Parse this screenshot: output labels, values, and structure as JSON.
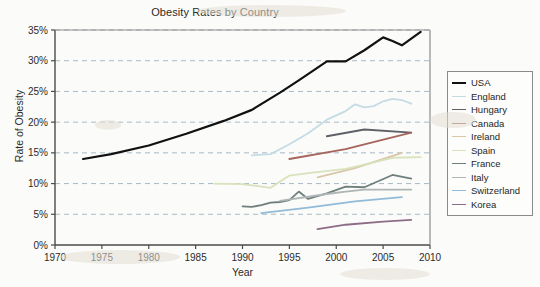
{
  "chart_data": {
    "type": "line",
    "title": "Obesity Rates by Country",
    "xlabel": "Year",
    "ylabel": "Rate of Obesity",
    "xlim": [
      1970,
      2010
    ],
    "ylim": [
      0,
      35
    ],
    "xticks": [
      "1970",
      "1975",
      "1980",
      "1985",
      "1990",
      "1995",
      "2000",
      "2005",
      "2010"
    ],
    "yticks": [
      "0%",
      "5%",
      "10%",
      "15%",
      "20%",
      "25%",
      "30%",
      "35%"
    ],
    "grid": "horizontal-dashed",
    "legend_position": "right-outside",
    "series": [
      {
        "name": "USA",
        "color": "#111111",
        "width": 2.2,
        "x": [
          1973,
          1976,
          1980,
          1984,
          1988,
          1991,
          1994,
          1996,
          1999,
          2001,
          2003,
          2005,
          2006,
          2007,
          2009
        ],
        "values": [
          14.0,
          14.8,
          16.2,
          18.1,
          20.2,
          22.0,
          24.8,
          26.8,
          29.9,
          29.9,
          31.7,
          33.8,
          33.2,
          32.5,
          34.7
        ]
      },
      {
        "name": "England",
        "color": "#c5dbe5",
        "width": 1.8,
        "x": [
          1991,
          1993,
          1995,
          1997,
          1999,
          2001,
          2002,
          2003,
          2004,
          2005,
          2006,
          2007,
          2008
        ],
        "values": [
          14.6,
          14.8,
          16.4,
          18.2,
          20.4,
          21.8,
          22.9,
          22.4,
          22.6,
          23.4,
          23.8,
          23.6,
          23.0
        ]
      },
      {
        "name": "Hungary",
        "color": "#5f6168",
        "width": 1.9,
        "x": [
          1999,
          2003,
          2008
        ],
        "values": [
          17.7,
          18.8,
          18.3
        ]
      },
      {
        "name": "Canada",
        "color": "#a5655c",
        "width": 1.8,
        "x": [
          1995,
          2001,
          2003,
          2008
        ],
        "values": [
          14.0,
          15.6,
          16.4,
          18.3
        ]
      },
      {
        "name": "Ireland",
        "color": "#d8c7a8",
        "width": 1.8,
        "x": [
          1998,
          2002,
          2007
        ],
        "values": [
          11.0,
          12.5,
          15.0
        ]
      },
      {
        "name": "Spain",
        "color": "#d8e2bc",
        "width": 1.8,
        "x": [
          1987,
          1990,
          1993,
          1995,
          1997,
          2001,
          2003,
          2006,
          2009
        ],
        "values": [
          10.0,
          9.9,
          9.3,
          11.3,
          11.7,
          12.4,
          13.1,
          14.2,
          14.3
        ]
      },
      {
        "name": "France",
        "color": "#6f7f7d",
        "width": 1.8,
        "x": [
          1990,
          1991,
          1992,
          1993,
          1994,
          1995,
          1996,
          1997,
          1999,
          2001,
          2003,
          2006,
          2008
        ],
        "values": [
          6.3,
          6.2,
          6.5,
          6.9,
          7.0,
          7.3,
          8.7,
          7.5,
          8.4,
          9.5,
          9.4,
          11.4,
          10.8
        ]
      },
      {
        "name": "Italy",
        "color": "#aeb5b6",
        "width": 1.8,
        "x": [
          1994,
          1999,
          2001,
          2003,
          2006,
          2008
        ],
        "values": [
          7.2,
          8.3,
          8.7,
          9.0,
          9.0,
          9.0
        ]
      },
      {
        "name": "Switzerland",
        "color": "#92bbd8",
        "width": 1.8,
        "x": [
          1992,
          1997,
          2002,
          2007
        ],
        "values": [
          5.2,
          6.1,
          7.1,
          7.8
        ]
      },
      {
        "name": "Korea",
        "color": "#8d6c87",
        "width": 1.8,
        "x": [
          1998,
          2001,
          2005,
          2008
        ],
        "values": [
          2.6,
          3.3,
          3.8,
          4.1
        ]
      }
    ]
  },
  "legend": {
    "items": [
      {
        "label": "USA"
      },
      {
        "label": "England"
      },
      {
        "label": "Hungary"
      },
      {
        "label": "Canada"
      },
      {
        "label": "Ireland"
      },
      {
        "label": "Spain"
      },
      {
        "label": "France"
      },
      {
        "label": "Italy"
      },
      {
        "label": "Switzerland"
      },
      {
        "label": "Korea"
      }
    ]
  }
}
